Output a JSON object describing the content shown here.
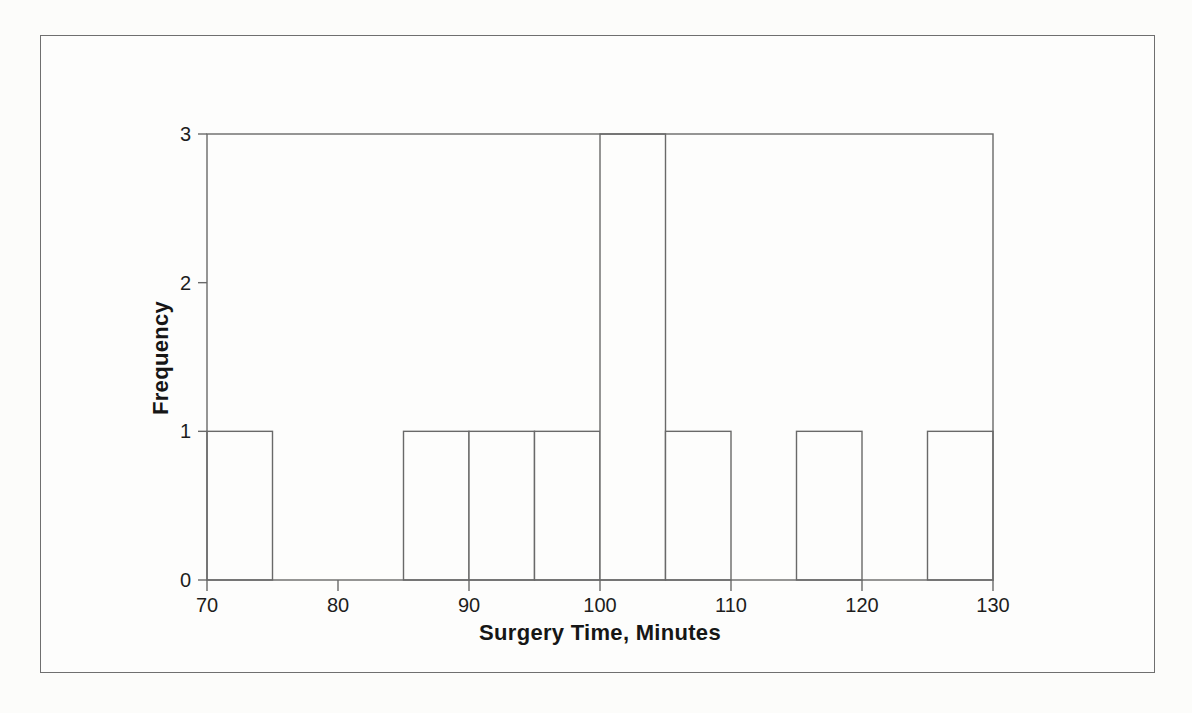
{
  "figure": {
    "background": "#fcfcfa",
    "border_color": "#6f6f6f"
  },
  "chart_data": {
    "type": "bar",
    "subtype": "histogram",
    "title": "",
    "xlabel": "Surgery Time, Minutes",
    "ylabel": "Frequency",
    "xlim": [
      70,
      130
    ],
    "ylim": [
      0,
      3
    ],
    "bin_width": 5,
    "bin_edges": [
      70,
      75,
      80,
      85,
      90,
      95,
      100,
      105,
      110,
      115,
      120,
      125,
      130
    ],
    "counts": [
      1,
      0,
      0,
      1,
      1,
      1,
      3,
      1,
      0,
      1,
      0,
      1
    ],
    "xticks": [
      "70",
      "80",
      "90",
      "100",
      "110",
      "120",
      "130"
    ],
    "xtick_values": [
      70,
      80,
      90,
      100,
      110,
      120,
      130
    ],
    "yticks": [
      "0",
      "1",
      "2",
      "3"
    ],
    "ytick_values": [
      0,
      1,
      2,
      3
    ],
    "grid": false,
    "frame": true,
    "legend_position": "none",
    "bar_fill": "#fdfdfc",
    "line_color": "#696969",
    "text_color": "#1d1d1d"
  }
}
